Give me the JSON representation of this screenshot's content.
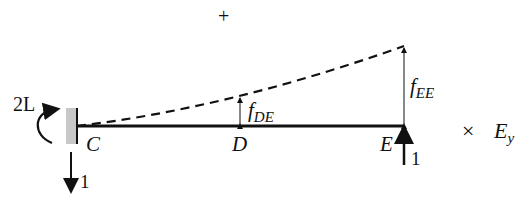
{
  "diagram": {
    "sign": "+",
    "moment_label": "2L",
    "support_force": "1",
    "points": {
      "C": "C",
      "D": "D",
      "E": "E"
    },
    "applied_load": "1",
    "deflection_D": {
      "base": "f",
      "sub": "DE"
    },
    "deflection_E": {
      "base": "f",
      "sub": "EE"
    },
    "multiplier": {
      "symbol": "×",
      "base": "E",
      "sub": "y"
    }
  }
}
